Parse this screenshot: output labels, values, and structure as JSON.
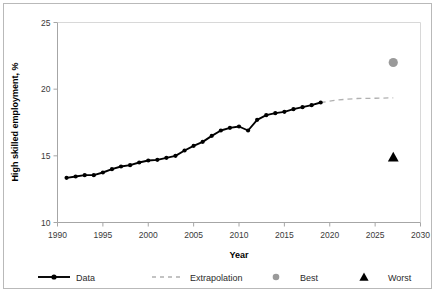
{
  "chart_data": {
    "type": "line",
    "title": "",
    "xlabel": "Year",
    "ylabel": "High skilled employment, %",
    "xlim": [
      1990,
      2030
    ],
    "ylim": [
      10,
      25
    ],
    "xticks": [
      1990,
      1995,
      2000,
      2005,
      2010,
      2015,
      2020,
      2025,
      2030
    ],
    "yticks": [
      10,
      15,
      20,
      25
    ],
    "grid": false,
    "legend_position": "bottom",
    "series": [
      {
        "name": "Data",
        "type": "line-markers",
        "color": "#000000",
        "marker": "circle",
        "x": [
          1991,
          1992,
          1993,
          1994,
          1995,
          1996,
          1997,
          1998,
          1999,
          2000,
          2001,
          2002,
          2003,
          2004,
          2005,
          2006,
          2007,
          2008,
          2009,
          2010,
          2011,
          2012,
          2013,
          2014,
          2015,
          2016,
          2017,
          2018,
          2019
        ],
        "values": [
          13.35,
          13.45,
          13.55,
          13.55,
          13.75,
          14.0,
          14.2,
          14.3,
          14.5,
          14.65,
          14.7,
          14.85,
          15.0,
          15.4,
          15.75,
          16.05,
          16.5,
          16.9,
          17.1,
          17.2,
          16.9,
          17.7,
          18.05,
          18.2,
          18.3,
          18.5,
          18.65,
          18.8,
          19.0
        ]
      },
      {
        "name": "Extrapolation",
        "type": "dashed-line",
        "color": "#b0b0b0",
        "x": [
          2019,
          2021,
          2023,
          2025,
          2027
        ],
        "values": [
          19.0,
          19.2,
          19.3,
          19.32,
          19.35
        ]
      },
      {
        "name": "Best",
        "type": "point",
        "color": "#9a9a9a",
        "marker": "circle",
        "x": [
          2027
        ],
        "values": [
          22.0
        ]
      },
      {
        "name": "Worst",
        "type": "point",
        "color": "#000000",
        "marker": "triangle",
        "x": [
          2027
        ],
        "values": [
          14.9
        ]
      }
    ]
  },
  "axes": {
    "y_title": "High skilled employment, %",
    "x_title": "Year",
    "x_tick_labels": [
      "1990",
      "1995",
      "2000",
      "2005",
      "2010",
      "2015",
      "2020",
      "2025",
      "2030"
    ],
    "y_tick_labels": [
      "10",
      "15",
      "20",
      "25"
    ]
  },
  "legend": {
    "items": [
      {
        "label": "Data",
        "marker": "line-with-dot",
        "color": "#000000"
      },
      {
        "label": "Extrapolation",
        "marker": "dashed-line",
        "color": "#b0b0b0"
      },
      {
        "label": "Best",
        "marker": "circle",
        "color": "#9a9a9a"
      },
      {
        "label": "Worst",
        "marker": "triangle",
        "color": "#000000"
      }
    ]
  },
  "colors": {
    "data_line": "#000000",
    "extrapolation": "#b0b0b0",
    "best_marker": "#9a9a9a",
    "worst_marker": "#000000",
    "axis": "#a6a6a6",
    "border": "#b9b9b9",
    "tick_text": "#3a3a3a"
  }
}
